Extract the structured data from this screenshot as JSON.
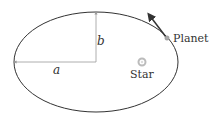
{
  "diagram": {
    "labels": {
      "semi_major": "a",
      "semi_minor": "b",
      "planet": "Planet",
      "star": "Star"
    },
    "colors": {
      "orbit": "#333333",
      "axis_lines": "#999999",
      "velocity_arrow": "#333333",
      "planet": "#aaaaaa",
      "star": "#bbbbbb",
      "text": "#333333"
    }
  }
}
